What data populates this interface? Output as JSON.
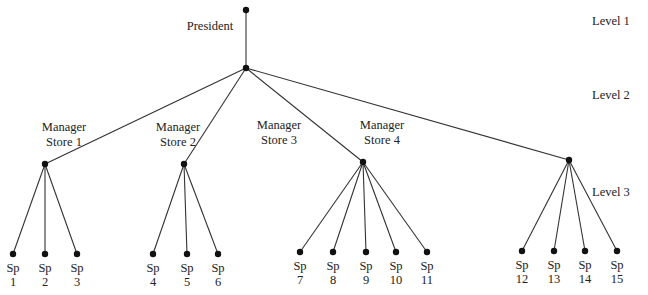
{
  "root": {
    "label": "President",
    "top": [
      246,
      10
    ],
    "hub": [
      246,
      68
    ]
  },
  "levels": [
    {
      "label": "Level 1",
      "x": 592,
      "y": 21
    },
    {
      "label": "Level 2",
      "x": 592,
      "y": 95
    },
    {
      "label": "Level 3",
      "x": 592,
      "y": 192
    }
  ],
  "managers": [
    {
      "line1": "Manager",
      "line2": "Store 1",
      "node": [
        45,
        164
      ],
      "label_x": 64,
      "label_y": 120,
      "children": [
        {
          "sp": "Sp",
          "n": "1",
          "x": 13
        },
        {
          "sp": "Sp",
          "n": "2",
          "x": 45
        },
        {
          "sp": "Sp",
          "n": "3",
          "x": 77
        }
      ]
    },
    {
      "line1": "Manager",
      "line2": "Store 2",
      "node": [
        184,
        164
      ],
      "label_x": 178,
      "label_y": 120,
      "children": [
        {
          "sp": "Sp",
          "n": "4",
          "x": 153
        },
        {
          "sp": "Sp",
          "n": "5",
          "x": 187
        },
        {
          "sp": "Sp",
          "n": "6",
          "x": 218
        }
      ]
    },
    {
      "line1": "Manager",
      "line2": "Store 3",
      "node": [
        363,
        162
      ],
      "label_x": 279,
      "label_y": 118,
      "children": [
        {
          "sp": "Sp",
          "n": "7",
          "x": 300
        },
        {
          "sp": "Sp",
          "n": "8",
          "x": 333
        },
        {
          "sp": "Sp",
          "n": "9",
          "x": 366
        },
        {
          "sp": "Sp",
          "n": "10",
          "x": 396
        },
        {
          "sp": "Sp",
          "n": "11",
          "x": 427
        }
      ]
    },
    {
      "line1": "Manager",
      "line2": "Store 4",
      "node": [
        569,
        160
      ],
      "label_x": 382,
      "label_y": 118,
      "children": [
        {
          "sp": "Sp",
          "n": "12",
          "x": 522
        },
        {
          "sp": "Sp",
          "n": "13",
          "x": 554
        },
        {
          "sp": "Sp",
          "n": "14",
          "x": 585
        },
        {
          "sp": "Sp",
          "n": "15",
          "x": 617
        }
      ]
    }
  ],
  "leaf_y": 254,
  "colors": {
    "line": "#333333",
    "node": "#111111",
    "text": "#222222"
  }
}
